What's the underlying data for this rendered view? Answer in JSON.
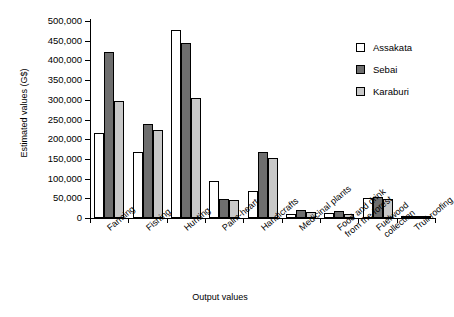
{
  "chart_data": {
    "type": "bar",
    "title": "",
    "xlabel": "Output values",
    "ylabel": "Estimated values (G$)",
    "ylim": [
      0,
      500000
    ],
    "ytick_step": 50000,
    "grid": false,
    "legend_position": "top-right",
    "ytick_labels": [
      "0",
      "50,000",
      "100,000",
      "150,000",
      "200,000",
      "250,000",
      "300,000",
      "350,000",
      "400,000",
      "450,000",
      "500,000"
    ],
    "categories": [
      "Farming",
      "Fishing",
      "Hunting",
      "Palm-heart",
      "Handicrafts",
      "Medicinal plants",
      "Food and drink\nfrom the forest",
      "Fuelwood\ncollection",
      "Truli roofing"
    ],
    "series": [
      {
        "name": "Assakata",
        "color": "#ffffff",
        "values": [
          217000,
          168000,
          476000,
          93000,
          69000,
          10000,
          13000,
          52000,
          2000
        ]
      },
      {
        "name": "Sebai",
        "color": "#6e6e6e",
        "values": [
          422000,
          238000,
          443000,
          49000,
          167000,
          20000,
          19000,
          54000,
          1500
        ]
      },
      {
        "name": "Karaburi",
        "color": "#c8c8c8",
        "values": [
          297000,
          224000,
          305000,
          45000,
          152000,
          16000,
          9000,
          49000,
          1000
        ]
      }
    ]
  },
  "legend": {
    "items": [
      {
        "label": "Assakata"
      },
      {
        "label": "Sebai"
      },
      {
        "label": "Karaburi"
      }
    ]
  }
}
